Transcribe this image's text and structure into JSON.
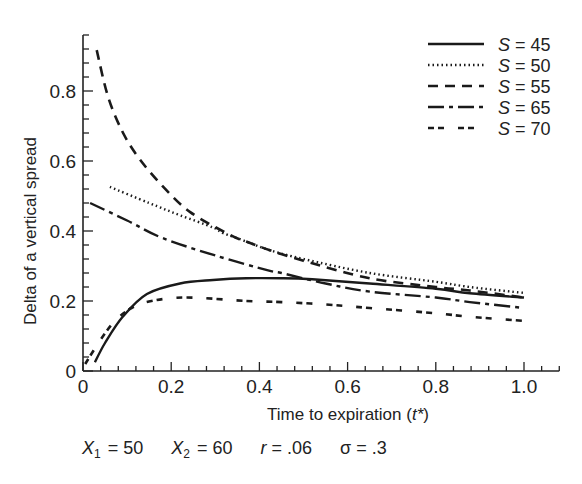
{
  "chart_data": {
    "type": "line",
    "title": "",
    "xlabel": "Time to expiration (t*)",
    "xlabel_parts": {
      "text": "Time to expiration (",
      "var": "t*",
      "close": ")"
    },
    "ylabel": "Delta of a vertical spread",
    "xlim": [
      0,
      1.08
    ],
    "ylim": [
      0,
      0.96
    ],
    "xticks": [
      0,
      0.2,
      0.4,
      0.6,
      0.8,
      1.0
    ],
    "xtick_labels": [
      "0",
      "0.2",
      "0.4",
      "0.6",
      "0.8",
      "1.0"
    ],
    "yticks": [
      0,
      0.2,
      0.4,
      0.6,
      0.8
    ],
    "ytick_labels": [
      "0",
      "0.2",
      "0.4",
      "0.6",
      "0.8"
    ],
    "minor_ticks_per_major": 4,
    "grid": false,
    "legend_position": "upper right",
    "series": [
      {
        "name": "S = 45",
        "var": "S",
        "value_label": "= 45",
        "dash": "solid",
        "width": 2.4,
        "x": [
          0.027,
          0.05,
          0.09,
          0.145,
          0.22,
          0.295,
          0.37,
          0.45,
          0.52,
          0.65,
          0.8,
          0.877,
          1.0
        ],
        "y": [
          0.025,
          0.08,
          0.155,
          0.22,
          0.25,
          0.26,
          0.265,
          0.265,
          0.262,
          0.25,
          0.235,
          0.222,
          0.21
        ]
      },
      {
        "name": "S = 50",
        "var": "S",
        "value_label": "= 50",
        "dash": "1.5,3",
        "width": 2.4,
        "x": [
          0.061,
          0.15,
          0.22,
          0.295,
          0.318,
          0.37,
          0.424,
          0.5,
          0.65,
          0.8,
          0.877,
          1.0
        ],
        "y": [
          0.526,
          0.48,
          0.445,
          0.41,
          0.394,
          0.37,
          0.345,
          0.32,
          0.28,
          0.255,
          0.24,
          0.223
        ]
      },
      {
        "name": "S = 55",
        "var": "S",
        "value_label": "= 55",
        "dash": "10,7",
        "width": 2.6,
        "x": [
          0.031,
          0.057,
          0.091,
          0.13,
          0.182,
          0.243,
          0.333,
          0.37,
          0.424,
          0.5,
          0.65,
          0.8,
          0.877,
          1.0
        ],
        "y": [
          0.917,
          0.783,
          0.68,
          0.603,
          0.526,
          0.454,
          0.389,
          0.37,
          0.345,
          0.315,
          0.265,
          0.24,
          0.23,
          0.21
        ]
      },
      {
        "name": "S = 65",
        "var": "S",
        "value_label": "= 65",
        "dash": "16,5,4,5",
        "width": 2.4,
        "x": [
          0.016,
          0.1,
          0.18,
          0.3,
          0.424,
          0.45,
          0.55,
          0.65,
          0.8,
          0.877,
          1.0
        ],
        "y": [
          0.48,
          0.43,
          0.38,
          0.33,
          0.286,
          0.28,
          0.25,
          0.227,
          0.21,
          0.197,
          0.18
        ]
      },
      {
        "name": "S = 70",
        "var": "S",
        "value_label": "= 70",
        "dash": "6,4,6,14",
        "width": 2.6,
        "x": [
          0.005,
          0.035,
          0.07,
          0.11,
          0.155,
          0.235,
          0.37,
          0.45,
          0.55,
          0.65,
          0.8,
          0.877,
          1.0
        ],
        "y": [
          0.02,
          0.08,
          0.14,
          0.18,
          0.2,
          0.21,
          0.2,
          0.197,
          0.19,
          0.18,
          0.165,
          0.155,
          0.143
        ]
      }
    ],
    "annotations": [
      {
        "var": "X",
        "sub": "1",
        "text": " = 50"
      },
      {
        "var": "X",
        "sub": "2",
        "text": " = 60"
      },
      {
        "var": "r",
        "sub": "",
        "text": " = .06"
      },
      {
        "var": "σ",
        "sub": "",
        "text": " = .3"
      }
    ]
  },
  "params": [
    {
      "var": "X",
      "sub": "1",
      "text": "= 50"
    },
    {
      "var": "X",
      "sub": "2",
      "text": "= 60"
    },
    {
      "var": "r",
      "sub": "",
      "text": "= .06"
    },
    {
      "var": "σ",
      "sub": "",
      "text": "= .3"
    }
  ]
}
